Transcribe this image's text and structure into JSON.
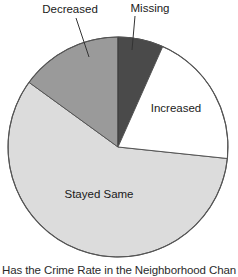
{
  "chart_data": {
    "type": "pie",
    "title": "Has the Crime Rate in the Neighborhood Chan",
    "xlabel": "",
    "ylabel": "",
    "legend_position": "none",
    "grid": false,
    "labels_inside": [
      "Increased",
      "Stayed Same"
    ],
    "labels_callout": [
      "Decreased",
      "Missing"
    ],
    "start_angle_deg": 0,
    "direction": "clockwise",
    "categories": [
      "Missing",
      "Increased",
      "Stayed Same",
      "Decreased"
    ],
    "values": [
      6.7,
      20.0,
      58.3,
      15.0
    ],
    "slices": [
      {
        "name": "Missing",
        "label": "Missing",
        "value": 6.7,
        "start_deg": 0,
        "end_deg": 24,
        "color": "#4a4a4a",
        "label_placement": "callout"
      },
      {
        "name": "Increased",
        "label": "Increased",
        "value": 20.0,
        "start_deg": 24,
        "end_deg": 96,
        "color": "#ffffff",
        "label_placement": "inside"
      },
      {
        "name": "Stayed Same",
        "label": "Stayed Same",
        "value": 58.3,
        "start_deg": 96,
        "end_deg": 306,
        "color": "#dcdcdc",
        "label_placement": "inside"
      },
      {
        "name": "Decreased",
        "label": "Decreased",
        "value": 15.0,
        "start_deg": 306,
        "end_deg": 360,
        "color": "#9a9a9a",
        "label_placement": "callout"
      }
    ]
  },
  "figure": {
    "caption": "Has the Crime Rate in the Neighborhood Chan",
    "outline_color": "#555555",
    "background": "#ffffff"
  },
  "labels": {
    "decreased": "Decreased",
    "missing": "Missing",
    "increased": "Increased",
    "stayed_same": "Stayed Same"
  }
}
